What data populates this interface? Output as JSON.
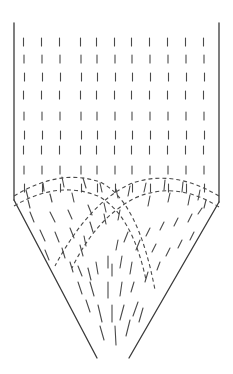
{
  "diagram": {
    "colors": {
      "line": "#3a3a3a",
      "dash": "#4a4a4a",
      "background": "#ffffff"
    },
    "walls": {
      "left_vertical": [
        [
          14,
          23
        ],
        [
          14,
          200
        ]
      ],
      "right_vertical": [
        [
          219,
          23
        ],
        [
          219,
          202
        ]
      ],
      "left_hopper": [
        [
          14,
          200
        ],
        [
          97,
          358
        ]
      ],
      "right_hopper": [
        [
          219,
          202
        ],
        [
          129,
          358
        ]
      ]
    },
    "vertical_flow": {
      "columns_x": [
        24,
        42,
        60,
        81,
        97,
        115,
        132,
        150,
        168,
        186,
        204
      ],
      "rows_y": [
        38,
        55,
        73,
        91,
        112,
        131,
        146,
        166,
        184
      ],
      "dash_length": 8
    },
    "arcs": [
      {
        "name": "left-outer-arc",
        "d": "M 14 196 Q 60 168 100 182 Q 138 200 155 290"
      },
      {
        "name": "left-inner-arc",
        "d": "M 14 206 Q 58 180 98 196 Q 132 214 146 280"
      },
      {
        "name": "right-outer-arc",
        "d": "M 219 196 Q 172 168 130 184 Q 88 204 55 266"
      },
      {
        "name": "right-inner-arc",
        "d": "M 219 207 Q 176 180 135 198 Q 96 218 72 268"
      }
    ],
    "hopper_dashes": [
      [
        30,
        212,
        34,
        222
      ],
      [
        50,
        212,
        55,
        222
      ],
      [
        68,
        210,
        72,
        219
      ],
      [
        88,
        205,
        92,
        215
      ],
      [
        40,
        230,
        45,
        241
      ],
      [
        55,
        232,
        59,
        242
      ],
      [
        70,
        228,
        74,
        238
      ],
      [
        90,
        222,
        93,
        232
      ],
      [
        45,
        250,
        49,
        260
      ],
      [
        62,
        248,
        65,
        258
      ],
      [
        80,
        245,
        83,
        256
      ],
      [
        70,
        262,
        73,
        272
      ],
      [
        78,
        266,
        82,
        276
      ],
      [
        88,
        268,
        91,
        280
      ],
      [
        96,
        262,
        98,
        274
      ],
      [
        108,
        256,
        108,
        268
      ],
      [
        112,
        264,
        112,
        276
      ],
      [
        122,
        256,
        120,
        268
      ],
      [
        132,
        262,
        130,
        274
      ],
      [
        78,
        282,
        82,
        294
      ],
      [
        90,
        282,
        94,
        296
      ],
      [
        108,
        282,
        108,
        298
      ],
      [
        122,
        282,
        120,
        296
      ],
      [
        134,
        282,
        131,
        292
      ],
      [
        86,
        300,
        90,
        312
      ],
      [
        98,
        305,
        102,
        322
      ],
      [
        112,
        305,
        112,
        322
      ],
      [
        124,
        305,
        120,
        320
      ],
      [
        138,
        302,
        133,
        316
      ],
      [
        148,
        272,
        145,
        282
      ],
      [
        160,
        262,
        157,
        270
      ],
      [
        170,
        248,
        166,
        256
      ],
      [
        182,
        240,
        178,
        248
      ],
      [
        194,
        232,
        190,
        240
      ],
      [
        150,
        228,
        146,
        236
      ],
      [
        164,
        222,
        160,
        230
      ],
      [
        178,
        218,
        174,
        226
      ],
      [
        192,
        214,
        188,
        222
      ],
      [
        202,
        208,
        198,
        214
      ],
      [
        156,
        244,
        152,
        252
      ],
      [
        140,
        240,
        136,
        250
      ],
      [
        128,
        232,
        124,
        242
      ],
      [
        100,
        326,
        104,
        340
      ],
      [
        115,
        326,
        116,
        345
      ],
      [
        130,
        320,
        126,
        336
      ],
      [
        143,
        308,
        139,
        322
      ],
      [
        120,
        210,
        118,
        220
      ],
      [
        104,
        214,
        106,
        224
      ],
      [
        84,
        236,
        86,
        246
      ],
      [
        118,
        240,
        116,
        250
      ]
    ],
    "arc_ticks": [
      [
        26,
        190,
        28,
        198
      ],
      [
        43,
        183,
        44,
        191
      ],
      [
        62,
        177,
        64,
        187
      ],
      [
        83,
        178,
        86,
        188
      ],
      [
        100,
        183,
        102,
        192
      ],
      [
        116,
        189,
        118,
        198
      ],
      [
        130,
        186,
        128,
        196
      ],
      [
        146,
        183,
        144,
        192
      ],
      [
        165,
        180,
        164,
        190
      ],
      [
        183,
        182,
        182,
        192
      ],
      [
        200,
        190,
        198,
        200
      ],
      [
        28,
        200,
        30,
        208
      ],
      [
        50,
        194,
        52,
        202
      ],
      [
        72,
        193,
        74,
        202
      ],
      [
        104,
        203,
        106,
        212
      ],
      [
        150,
        196,
        148,
        206
      ],
      [
        170,
        193,
        168,
        202
      ],
      [
        190,
        195,
        188,
        205
      ],
      [
        206,
        200,
        204,
        208
      ]
    ]
  }
}
